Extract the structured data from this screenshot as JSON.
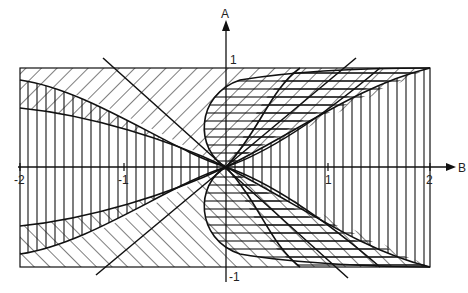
{
  "diagram": {
    "type": "hatched-region-plot",
    "axes": {
      "x_label": "B",
      "y_label": "A",
      "x_ticks": [
        {
          "value": -2,
          "label": "-2"
        },
        {
          "value": -1,
          "label": "-1"
        },
        {
          "value": 1,
          "label": "1"
        },
        {
          "value": 2,
          "label": "2"
        }
      ],
      "y_ticks": [
        {
          "value": 1,
          "label": "1"
        },
        {
          "value": -1,
          "label": "-1"
        }
      ],
      "x_range": [
        -2,
        2
      ],
      "y_range": [
        -1,
        1
      ]
    },
    "regions": [
      {
        "name": "vertical-hatch-region",
        "hatch": "vertical",
        "description": "Band region between curves, left half and right side"
      },
      {
        "name": "diagonal-hatch-upper-left",
        "hatch": "diagonal-forward",
        "description": "Upper-left area above curve toward A=1"
      },
      {
        "name": "diagonal-hatch-lower-left",
        "hatch": "diagonal-back",
        "description": "Lower-left area below curve toward A=-1"
      },
      {
        "name": "horizontal-hatch-center-right",
        "hatch": "horizontal",
        "description": "Region bounded by S-shaped curves right of origin"
      }
    ],
    "lines": [
      {
        "name": "diagonal-line-1",
        "description": "Line through origin from upper-left to lower-right"
      },
      {
        "name": "diagonal-line-2",
        "description": "Line through origin from lower-left to upper-right"
      }
    ]
  }
}
